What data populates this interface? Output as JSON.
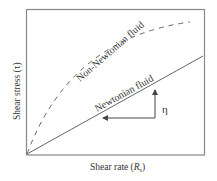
{
  "figure": {
    "xlabel": "Shear rate (",
    "xlabel_symbol": "R",
    "xlabel_sub": "s",
    "xlabel_close": ")",
    "ylabel": "Shear stress (τ)",
    "series": [
      {
        "name": "Non-Newtonian fluid",
        "style": "dashed",
        "color": "#555555"
      },
      {
        "name": "Newtonian fluid",
        "style": "solid",
        "color": "#555555"
      }
    ],
    "slope_symbol": "η"
  }
}
